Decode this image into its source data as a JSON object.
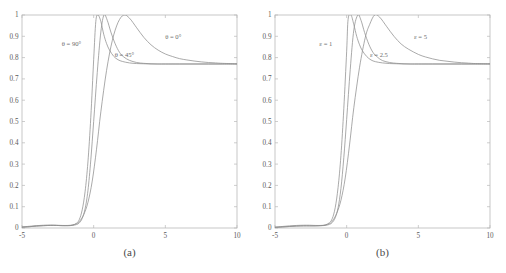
{
  "figure": {
    "panels": [
      {
        "caption": "(a)",
        "xlabel": "",
        "ylabel": "",
        "xticks": [
          "-5",
          "0",
          "5",
          "10"
        ],
        "yticks": [
          "0",
          "0.1",
          "0.2",
          "0.3",
          "0.4",
          "0.5",
          "0.6",
          "0.7",
          "0.8",
          "0.9",
          "1"
        ],
        "curve_labels": [
          {
            "text": "θ = 90°",
            "x": -1.55,
            "y": 0.855
          },
          {
            "text": "θ = 45°",
            "x": 2.15,
            "y": 0.805
          },
          {
            "text": "θ = 0°",
            "x": 5.55,
            "y": 0.885
          }
        ]
      },
      {
        "caption": "(b)",
        "xlabel": "",
        "ylabel": "",
        "xticks": [
          "-5",
          "0",
          "5",
          "10"
        ],
        "yticks": [
          "0",
          "0.1",
          "0.2",
          "0.3",
          "0.4",
          "0.5",
          "0.6",
          "0.7",
          "0.8",
          "0.9",
          "1"
        ],
        "curve_labels": [
          {
            "text": "ε = 1",
            "x": -1.45,
            "y": 0.855
          },
          {
            "text": "ε = 2.5",
            "x": 2.25,
            "y": 0.805
          },
          {
            "text": "ε = 5",
            "x": 5.15,
            "y": 0.885
          }
        ]
      }
    ],
    "colors": {
      "curve": "#8e8e8e",
      "axis": "#b9b9b9",
      "text": "#5a5a5a",
      "background": "#ffffff"
    }
  },
  "chart_data": [
    {
      "type": "line",
      "title": "(a)",
      "xlabel": "",
      "ylabel": "",
      "xlim": [
        -5,
        10
      ],
      "ylim": [
        0,
        1
      ],
      "xticks": [
        -5,
        0,
        5,
        10
      ],
      "yticks": [
        0,
        0.1,
        0.2,
        0.3,
        0.4,
        0.5,
        0.6,
        0.7,
        0.8,
        0.9,
        1
      ],
      "grid": false,
      "legend": "inline-annotations",
      "plateau": 0.77,
      "series": [
        {
          "name": "θ = 90°",
          "peak_x": 0.15,
          "peak_y": 1.0,
          "x": [
            -5,
            -4.5,
            -4,
            -3.5,
            -3,
            -2.6,
            -2.2,
            -1.8,
            -1.5,
            -1.2,
            -1,
            -0.8,
            -0.6,
            -0.4,
            -0.2,
            0,
            0.15,
            0.3,
            0.5,
            0.7,
            0.9,
            1.1,
            1.4,
            1.7,
            2,
            2.5,
            3,
            3.5,
            4,
            5,
            6,
            7,
            8,
            9,
            10
          ],
          "y": [
            0.004,
            0.006,
            0.009,
            0.011,
            0.012,
            0.012,
            0.011,
            0.011,
            0.013,
            0.022,
            0.04,
            0.085,
            0.17,
            0.31,
            0.52,
            0.79,
            0.97,
            1.0,
            0.97,
            0.91,
            0.866,
            0.836,
            0.806,
            0.79,
            0.782,
            0.775,
            0.772,
            0.771,
            0.77,
            0.77,
            0.77,
            0.77,
            0.77,
            0.77,
            0.77
          ]
        },
        {
          "name": "θ = 45°",
          "peak_x": 0.72,
          "peak_y": 1.0,
          "x": [
            -5,
            -4.5,
            -4,
            -3.5,
            -3,
            -2.6,
            -2.2,
            -1.8,
            -1.5,
            -1.2,
            -1,
            -0.8,
            -0.6,
            -0.4,
            -0.2,
            0,
            0.25,
            0.5,
            0.72,
            0.95,
            1.2,
            1.5,
            1.8,
            2.1,
            2.5,
            3,
            3.5,
            4,
            4.5,
            5,
            6,
            7,
            8,
            9,
            10
          ],
          "y": [
            0.004,
            0.006,
            0.009,
            0.011,
            0.012,
            0.012,
            0.011,
            0.011,
            0.012,
            0.016,
            0.024,
            0.045,
            0.09,
            0.175,
            0.32,
            0.5,
            0.73,
            0.92,
            1.0,
            0.975,
            0.92,
            0.865,
            0.825,
            0.803,
            0.787,
            0.777,
            0.773,
            0.771,
            0.77,
            0.77,
            0.77,
            0.77,
            0.77,
            0.77,
            0.77
          ]
        },
        {
          "name": "θ = 0°",
          "peak_x": 2.1,
          "peak_y": 1.0,
          "x": [
            -5,
            -4.5,
            -4,
            -3.5,
            -3,
            -2.6,
            -2.2,
            -1.8,
            -1.5,
            -1.2,
            -1,
            -0.7,
            -0.4,
            -0.1,
            0.2,
            0.5,
            0.9,
            1.3,
            1.7,
            2.1,
            2.5,
            3,
            3.5,
            4,
            4.5,
            5,
            5.5,
            6,
            6.5,
            7,
            7.5,
            8,
            8.5,
            9,
            10
          ],
          "y": [
            0.005,
            0.008,
            0.011,
            0.013,
            0.014,
            0.013,
            0.012,
            0.012,
            0.014,
            0.02,
            0.03,
            0.062,
            0.12,
            0.22,
            0.37,
            0.545,
            0.74,
            0.88,
            0.965,
            1.0,
            0.985,
            0.94,
            0.895,
            0.86,
            0.835,
            0.817,
            0.805,
            0.795,
            0.789,
            0.784,
            0.78,
            0.777,
            0.775,
            0.773,
            0.771
          ]
        }
      ]
    },
    {
      "type": "line",
      "title": "(b)",
      "xlabel": "",
      "ylabel": "",
      "xlim": [
        -5,
        10
      ],
      "ylim": [
        0,
        1
      ],
      "xticks": [
        -5,
        0,
        5,
        10
      ],
      "yticks": [
        0,
        0.1,
        0.2,
        0.3,
        0.4,
        0.5,
        0.6,
        0.7,
        0.8,
        0.9,
        1
      ],
      "grid": false,
      "legend": "inline-annotations",
      "plateau": 0.77,
      "series": [
        {
          "name": "ε = 1",
          "peak_x": 0.1,
          "peak_y": 1.0,
          "x": [
            -5,
            -4.5,
            -4,
            -3.5,
            -3,
            -2.6,
            -2.2,
            -1.8,
            -1.5,
            -1.2,
            -1,
            -0.8,
            -0.6,
            -0.4,
            -0.2,
            0,
            0.1,
            0.3,
            0.5,
            0.7,
            0.9,
            1.1,
            1.4,
            1.7,
            2,
            2.5,
            3,
            3.5,
            4,
            5,
            6,
            7,
            8,
            9,
            10
          ],
          "y": [
            0.003,
            0.005,
            0.007,
            0.009,
            0.01,
            0.01,
            0.01,
            0.011,
            0.014,
            0.025,
            0.045,
            0.095,
            0.19,
            0.34,
            0.56,
            0.83,
            0.98,
            1.0,
            0.955,
            0.9,
            0.86,
            0.832,
            0.805,
            0.789,
            0.781,
            0.775,
            0.772,
            0.771,
            0.77,
            0.77,
            0.77,
            0.77,
            0.77,
            0.77,
            0.77
          ]
        },
        {
          "name": "ε = 2.5",
          "peak_x": 0.78,
          "peak_y": 1.0,
          "x": [
            -5,
            -4.5,
            -4,
            -3.5,
            -3,
            -2.6,
            -2.2,
            -1.8,
            -1.5,
            -1.2,
            -1,
            -0.8,
            -0.6,
            -0.4,
            -0.2,
            0,
            0.25,
            0.5,
            0.78,
            1,
            1.25,
            1.55,
            1.85,
            2.15,
            2.5,
            3,
            3.5,
            4,
            4.5,
            5,
            6,
            7,
            8,
            9,
            10
          ],
          "y": [
            0.003,
            0.005,
            0.007,
            0.009,
            0.01,
            0.01,
            0.01,
            0.011,
            0.012,
            0.017,
            0.026,
            0.048,
            0.095,
            0.185,
            0.33,
            0.51,
            0.745,
            0.93,
            1.0,
            0.975,
            0.918,
            0.862,
            0.823,
            0.802,
            0.786,
            0.777,
            0.773,
            0.771,
            0.77,
            0.77,
            0.77,
            0.77,
            0.77,
            0.77,
            0.77
          ]
        },
        {
          "name": "ε = 5",
          "peak_x": 1.95,
          "peak_y": 1.0,
          "x": [
            -5,
            -4.5,
            -4,
            -3.5,
            -3,
            -2.6,
            -2.2,
            -1.8,
            -1.5,
            -1.2,
            -1,
            -0.7,
            -0.4,
            -0.1,
            0.2,
            0.5,
            0.9,
            1.3,
            1.6,
            1.95,
            2.3,
            2.8,
            3.3,
            3.8,
            4.3,
            5,
            5.5,
            6,
            6.5,
            7,
            7.5,
            8,
            8.5,
            9,
            10
          ],
          "y": [
            0.004,
            0.007,
            0.01,
            0.012,
            0.013,
            0.013,
            0.012,
            0.012,
            0.014,
            0.021,
            0.032,
            0.068,
            0.13,
            0.235,
            0.39,
            0.565,
            0.755,
            0.895,
            0.955,
            1.0,
            0.99,
            0.945,
            0.9,
            0.864,
            0.84,
            0.815,
            0.803,
            0.794,
            0.787,
            0.783,
            0.779,
            0.776,
            0.774,
            0.772,
            0.771
          ]
        }
      ]
    }
  ]
}
